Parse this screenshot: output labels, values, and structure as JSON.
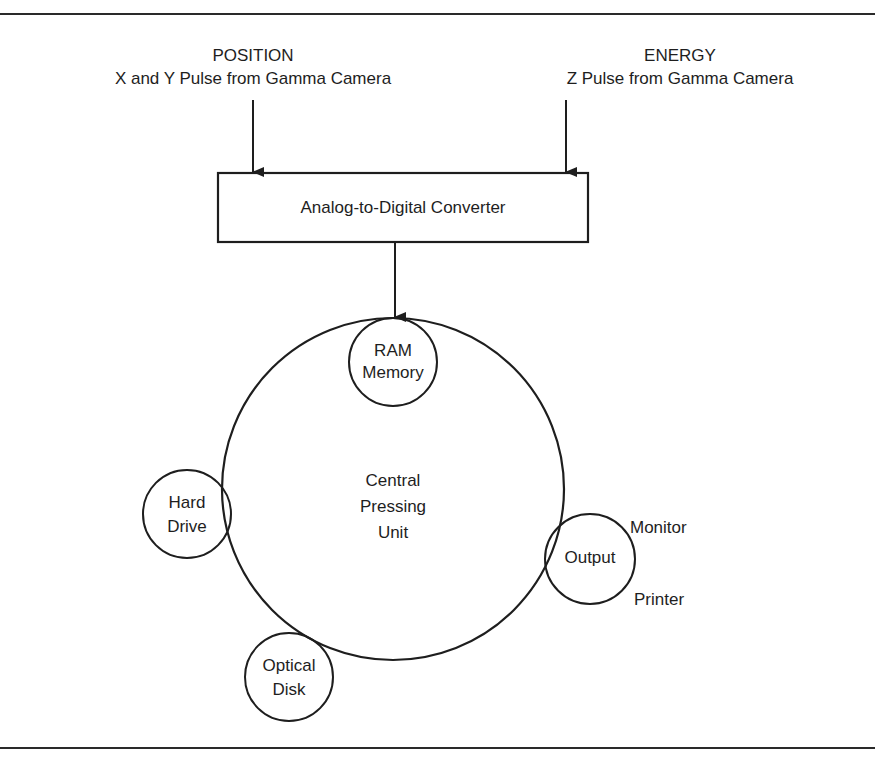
{
  "figure": {
    "title_partial": "Figure: Computer components in nuclear medicine gamma camera imaging"
  },
  "inputs": {
    "position": {
      "title": "POSITION",
      "subtitle": "X and Y Pulse from Gamma Camera"
    },
    "energy": {
      "title": "ENERGY",
      "subtitle": "Z Pulse from Gamma Camera"
    }
  },
  "converter": {
    "label": "Analog-to-Digital Converter"
  },
  "cpu": {
    "line1": "Central",
    "line2": "Pressing",
    "line3": "Unit"
  },
  "peripherals": {
    "ram": {
      "line1": "RAM",
      "line2": "Memory"
    },
    "hard_drive": {
      "line1": "Hard",
      "line2": "Drive"
    },
    "optical_disk": {
      "line1": "Optical",
      "line2": "Disk"
    },
    "output": {
      "label": "Output",
      "monitor": "Monitor",
      "printer": "Printer"
    }
  },
  "colors": {
    "stroke": "#1e1e1e",
    "background": "#ffffff"
  }
}
